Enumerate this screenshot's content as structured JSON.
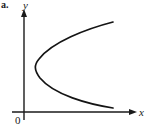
{
  "figure": {
    "item_label": "a.",
    "axis_color": "#1a1a1a",
    "curve_color": "#141414",
    "background_color": "#ffffff"
  },
  "labels": {
    "y_axis": "y",
    "x_axis": "x",
    "origin": "0"
  },
  "chart_data": {
    "type": "line",
    "title": "",
    "xlabel": "x",
    "ylabel": "y",
    "annotations": [
      "0"
    ],
    "grid": false,
    "legend": null,
    "axis_ranges": {
      "x_pixel": [
        12,
        133
      ],
      "y_pixel": [
        12,
        120
      ]
    },
    "axes": {
      "y_axis_x_pixel": 24,
      "x_axis_y_pixel": 112,
      "y_axis_top_pixel": 12,
      "y_axis_bottom_pixel": 120,
      "x_axis_left_pixel": 12,
      "x_axis_right_pixel": 133,
      "arrows": [
        "y-up",
        "x-right"
      ]
    },
    "curve": {
      "shape": "parabola-opening-right",
      "vertex_pixel": [
        38,
        65
      ],
      "upper_endpoint_pixel": [
        113,
        22
      ],
      "lower_endpoint_pixel": [
        113,
        108
      ],
      "path": "M 113 22 C 86 29, 52 42, 39 59 C 34 65, 34 70, 40 78 C 54 95, 88 104, 113 108"
    }
  }
}
